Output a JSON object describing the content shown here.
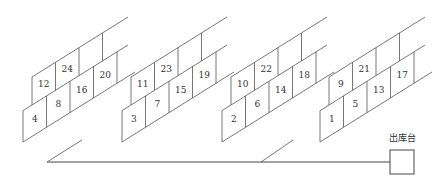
{
  "diagram": {
    "type": "warehouse-shelf-layout",
    "line_color": "#555555",
    "groups": [
      {
        "name": "group-1",
        "offset_x": 0,
        "upper_row": [
          "12",
          "24",
          ""
        ],
        "lower_row": [
          "4",
          "8",
          "16",
          "20"
        ]
      },
      {
        "name": "group-2",
        "offset_x": 99,
        "upper_row": [
          "11",
          "23",
          ""
        ],
        "lower_row": [
          "3",
          "7",
          "15",
          "19"
        ]
      },
      {
        "name": "group-3",
        "offset_x": 199,
        "upper_row": [
          "10",
          "22",
          ""
        ],
        "lower_row": [
          "2",
          "6",
          "14",
          "18"
        ]
      },
      {
        "name": "group-4",
        "offset_x": 297,
        "upper_row": [
          "9",
          "21",
          ""
        ],
        "lower_row": [
          "1",
          "5",
          "13",
          "17"
        ]
      }
    ],
    "output_station": {
      "label": "出库台"
    }
  }
}
